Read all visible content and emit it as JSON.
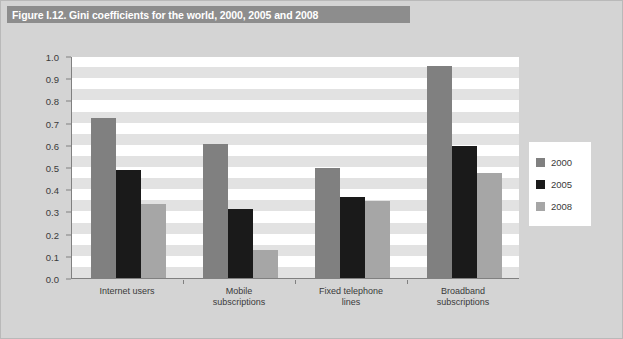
{
  "figure": {
    "title": "Figure I.12. Gini coefficients for the world, 2000, 2005 and 2008"
  },
  "colors": {
    "series_2000": "#808080",
    "series_2005": "#1a1a1a",
    "series_2008": "#a6a6a6",
    "title_bar": "#8d8d8d",
    "page_background": "#d4d4d4",
    "plot_background": "#ffffff",
    "band": "#e2e2e2",
    "axis_line": "#808080"
  },
  "legend": {
    "position": "right",
    "entries": [
      {
        "label": "2000",
        "color": "#808080"
      },
      {
        "label": "2005",
        "color": "#1a1a1a"
      },
      {
        "label": "2008",
        "color": "#a6a6a6"
      }
    ]
  },
  "y_axis": {
    "ticks": [
      "0.0",
      "0.1",
      "0.2",
      "0.3",
      "0.4",
      "0.5",
      "0.6",
      "0.7",
      "0.8",
      "0.9",
      "1.0"
    ]
  },
  "x_axis": {
    "categories": [
      {
        "line1": "Internet users",
        "line2": ""
      },
      {
        "line1": "Mobile",
        "line2": "subscriptions"
      },
      {
        "line1": "Fixed telephone",
        "line2": "lines"
      },
      {
        "line1": "Broadband",
        "line2": "subscriptions"
      }
    ]
  },
  "chart_data": {
    "type": "bar",
    "title": "Figure I.12. Gini coefficients for the world, 2000, 2005 and 2008",
    "xlabel": "",
    "ylabel": "",
    "ylim": [
      0,
      1.0
    ],
    "ytick_step": 0.1,
    "grid": true,
    "legend_position": "right",
    "categories": [
      "Internet users",
      "Mobile subscriptions",
      "Fixed telephone lines",
      "Broadband subscriptions"
    ],
    "series": [
      {
        "name": "2000",
        "color": "#808080",
        "values": [
          0.72,
          0.605,
          0.495,
          0.955
        ]
      },
      {
        "name": "2005",
        "color": "#1a1a1a",
        "values": [
          0.485,
          0.31,
          0.365,
          0.595
        ]
      },
      {
        "name": "2008",
        "color": "#a6a6a6",
        "values": [
          0.335,
          0.125,
          0.345,
          0.475
        ]
      }
    ]
  }
}
